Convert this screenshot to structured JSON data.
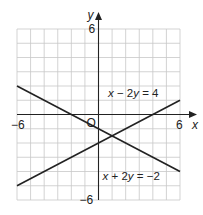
{
  "chart_data": {
    "type": "line",
    "title": "",
    "xlabel": "x",
    "ylabel": "y",
    "xlim": [
      -6,
      6
    ],
    "ylim": [
      -6,
      6
    ],
    "grid": true,
    "grid_step": 1,
    "origin_label": "O",
    "x_tick_labels": [
      {
        "value": -6,
        "label": "−6"
      },
      {
        "value": 6,
        "label": "6"
      }
    ],
    "y_tick_labels": [
      {
        "value": 6,
        "label": "6"
      },
      {
        "value": -6,
        "label": "−6"
      }
    ],
    "series": [
      {
        "name": "x − 2y = 4",
        "equation": "x - 2y = 4",
        "x": [
          -6,
          6
        ],
        "y": [
          -5,
          1
        ]
      },
      {
        "name": "x + 2y = −2",
        "equation": "x + 2y = -2",
        "x": [
          -6,
          6
        ],
        "y": [
          2,
          -4
        ]
      }
    ],
    "annotations": [
      {
        "text_parts": [
          "x",
          " − 2",
          "y",
          " = 4"
        ],
        "series": 0
      },
      {
        "text_parts": [
          "x",
          " + 2",
          "y",
          " = −2"
        ],
        "series": 1
      }
    ]
  }
}
